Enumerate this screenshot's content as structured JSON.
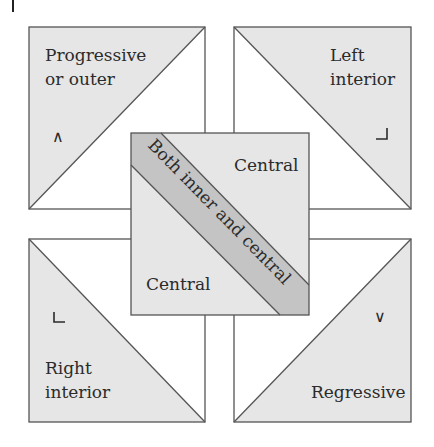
{
  "diagram": {
    "panels": {
      "top_left": {
        "label_lines": [
          "Progressive",
          "or outer"
        ],
        "symbol": "∧",
        "symbol_name": "wedge-up-icon"
      },
      "top_right": {
        "label_lines": [
          "Left",
          "interior"
        ],
        "symbol": "⌟",
        "symbol_name": "corner-bottom-right-icon"
      },
      "bottom_left": {
        "label_lines": [
          "Right",
          "interior"
        ],
        "symbol": "∟",
        "symbol_name": "corner-bottom-left-icon"
      },
      "bottom_right": {
        "label_lines": [
          "Regressive"
        ],
        "symbol": "∨",
        "symbol_name": "wedge-down-icon"
      }
    },
    "center": {
      "upper_label": "Central",
      "lower_label": "Central",
      "band_label": "Both inner and central"
    },
    "colors": {
      "shade": "#e6e6e6",
      "band": "#c4c4c4",
      "stroke": "#555555",
      "text": "#2b2b2b"
    }
  }
}
